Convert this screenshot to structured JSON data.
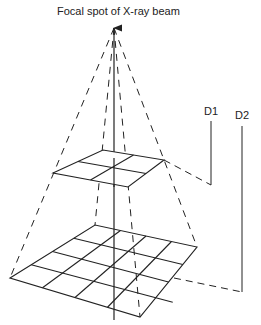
{
  "diagram": {
    "title": "Focal spot of X-ray beam",
    "labels": {
      "d1": "D1",
      "d2": "D2"
    },
    "colors": {
      "line": "#222222",
      "background": "#ffffff"
    },
    "elements": {
      "focal_spot": "apex-arrow",
      "upper_grid": {
        "rows": 2,
        "cols": 2
      },
      "lower_grid": {
        "rows": 4,
        "cols": 4
      },
      "beam_edges": "dashed",
      "central_ray": "solid"
    }
  }
}
